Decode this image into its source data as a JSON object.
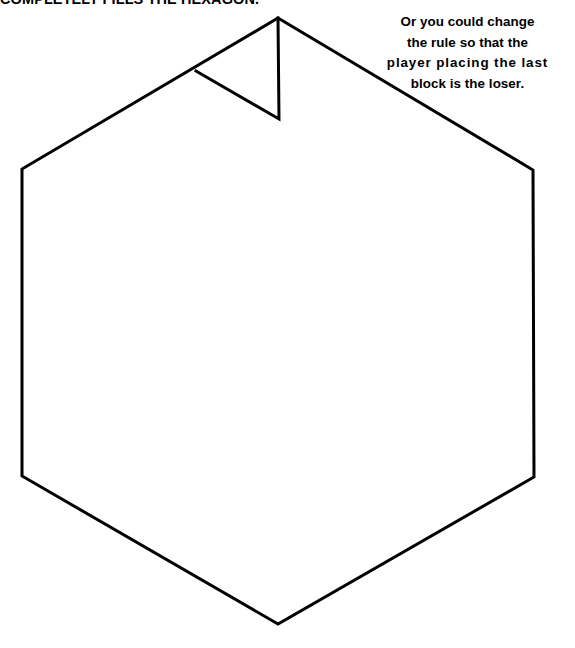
{
  "page": {
    "background_color": "#ffffff",
    "width": 575,
    "height": 648
  },
  "heading": {
    "text": "COMPLETELY FILLS THE HEXAGON.",
    "note": "clipped at top edge of page",
    "color": "#000000"
  },
  "caption": {
    "lines": [
      "Or you could change",
      "the rule so that the",
      "player placing the last",
      "block is the loser."
    ],
    "color": "#000000"
  },
  "figure": {
    "name": "hexagon-with-triangular-notch",
    "stroke_color": "#000000",
    "fill_color": "#ffffff",
    "stroke_width": 3,
    "hexagon_points": "278,18 533,170 534,477 278,624 22,476 22,169",
    "notch_apex": "278,18",
    "notch_vertical_end": "279,119",
    "notch_edge_point": "196,71",
    "notch_path": "M 278,18 L 279,119 L 196,71"
  }
}
